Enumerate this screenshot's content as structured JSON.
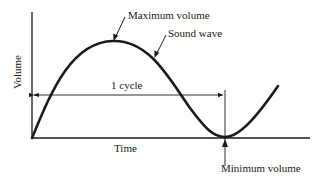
{
  "diagram": {
    "type": "sound-wave-cycle",
    "axes": {
      "x_label": "Time",
      "y_label": "Volume"
    },
    "annotations": {
      "maximum": "Maximum volume",
      "wave": "Sound wave",
      "cycle": "1 cycle",
      "minimum": "Minimum volume"
    },
    "colors": {
      "ink": "#1a1a1a",
      "background": "#ffffff"
    }
  }
}
